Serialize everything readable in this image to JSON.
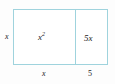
{
  "diagram": {
    "type": "area-model",
    "border_color": "#9fd3dd",
    "fill_color": "#ffffff",
    "text_color": "#1a1a1a",
    "regions": [
      {
        "name": "square-region",
        "base_text": "x",
        "exponent_text": "2",
        "width_label": "x",
        "height_label": "x"
      },
      {
        "name": "rect-region",
        "label": "5x",
        "width_label": "5",
        "height_label": "x"
      }
    ],
    "labels": {
      "left_height": "x",
      "bottom_left_width": "x",
      "bottom_right_width": "5",
      "square_base": "x",
      "square_exponent": "2",
      "rect": "5x"
    }
  }
}
